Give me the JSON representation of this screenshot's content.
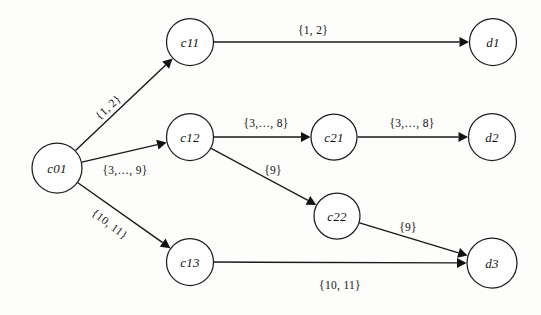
{
  "figure": {
    "type": "directed-graph",
    "background_color": "#fdfdfc",
    "stroke_color": "#1a1a1a"
  },
  "nodes": [
    {
      "id": "c01",
      "label": "c01",
      "cx": 57,
      "cy": 168,
      "r": 25,
      "layer": 0
    },
    {
      "id": "c11",
      "label": "c11",
      "cx": 190,
      "cy": 42,
      "r": 23.5,
      "layer": 1
    },
    {
      "id": "c12",
      "label": "c12",
      "cx": 190,
      "cy": 137,
      "r": 23.5,
      "layer": 1
    },
    {
      "id": "c13",
      "label": "c13",
      "cx": 190,
      "cy": 262,
      "r": 23.5,
      "layer": 1
    },
    {
      "id": "c21",
      "label": "c21",
      "cx": 334,
      "cy": 137,
      "r": 23,
      "layer": 2
    },
    {
      "id": "c22",
      "label": "c22",
      "cx": 337,
      "cy": 216,
      "r": 23,
      "layer": 2
    },
    {
      "id": "d1",
      "label": "d1",
      "cx": 493,
      "cy": 42,
      "r": 23.5,
      "layer": 3
    },
    {
      "id": "d2",
      "label": "d2",
      "cx": 492,
      "cy": 137,
      "r": 23.5,
      "layer": 3
    },
    {
      "id": "d3",
      "label": "d3",
      "cx": 492,
      "cy": 263,
      "r": 25,
      "layer": 3
    }
  ],
  "edges": [
    {
      "id": "e-c01-c11",
      "from": "c01",
      "to": "c11",
      "label": "{1, 2}",
      "label_x": 108,
      "label_y": 107,
      "label_rotate": -43
    },
    {
      "id": "e-c01-c12",
      "from": "c01",
      "to": "c12",
      "label": "{3,…, 9}",
      "label_x": 125,
      "label_y": 170,
      "label_rotate": 0
    },
    {
      "id": "e-c01-c13",
      "from": "c01",
      "to": "c13",
      "label": "{10, 11}",
      "label_x": 110,
      "label_y": 224,
      "label_rotate": 37
    },
    {
      "id": "e-c11-d1",
      "from": "c11",
      "to": "d1",
      "label": "{1, 2}",
      "label_x": 313,
      "label_y": 30,
      "label_rotate": 0
    },
    {
      "id": "e-c12-c21",
      "from": "c12",
      "to": "c21",
      "label": "{3,…, 8}",
      "label_x": 266,
      "label_y": 123,
      "label_rotate": 0
    },
    {
      "id": "e-c12-c22",
      "from": "c12",
      "to": "c22",
      "label": "{9}",
      "label_x": 273,
      "label_y": 170,
      "label_rotate": 0
    },
    {
      "id": "e-c13-d3",
      "from": "c13",
      "to": "d3",
      "label": "{10, 11}",
      "label_x": 340,
      "label_y": 285,
      "label_rotate": 0
    },
    {
      "id": "e-c21-d2",
      "from": "c21",
      "to": "d2",
      "label": "{3,…, 8}",
      "label_x": 412,
      "label_y": 123,
      "label_rotate": 0
    },
    {
      "id": "e-c22-d3",
      "from": "c22",
      "to": "d3",
      "label": "{9}",
      "label_x": 408,
      "label_y": 227,
      "label_rotate": 0
    }
  ]
}
